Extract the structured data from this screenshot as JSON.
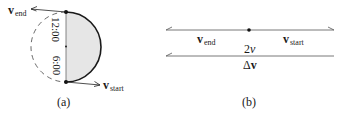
{
  "panel_a": {
    "caption": "(a)",
    "v_end": {
      "symbol": "v",
      "subscript": "end"
    },
    "v_start": {
      "symbol": "v",
      "subscript": "start"
    },
    "clock_top": "12:00",
    "clock_bottom": "6:00",
    "fill_color": "#e6e6e6",
    "stroke_color": "#1a1a1a"
  },
  "panel_b": {
    "caption": "(b)",
    "v_end": {
      "symbol": "v",
      "subscript": "end"
    },
    "v_start": {
      "symbol": "v",
      "subscript": "start"
    },
    "magnitude": "2",
    "magnitude_var": "v",
    "delta": "Δ",
    "delta_symbol": "v"
  }
}
